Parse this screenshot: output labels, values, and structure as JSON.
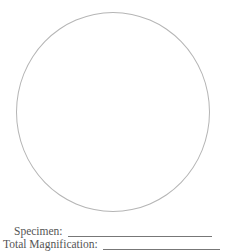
{
  "worksheet": {
    "field_of_view": {
      "shape": "circle",
      "stroke_color": "#b5b5b5"
    },
    "fields": [
      {
        "label": "Specimen:",
        "value": ""
      },
      {
        "label": "Total Magnification:",
        "value": ""
      }
    ]
  }
}
